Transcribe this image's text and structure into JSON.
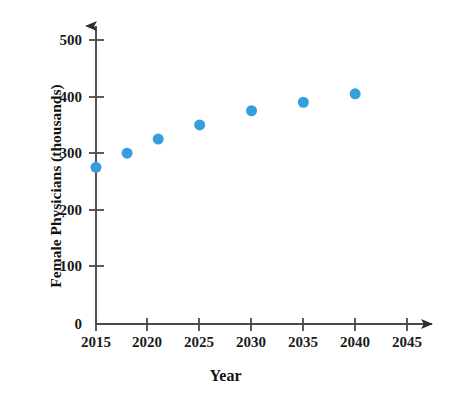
{
  "chart_data": {
    "type": "scatter",
    "title": "",
    "xlabel": "Year",
    "ylabel": "Female Physicians (thousands)",
    "x": [
      2015,
      2018,
      2021,
      2025,
      2030,
      2035,
      2040
    ],
    "values": [
      275,
      300,
      325,
      350,
      375,
      390,
      405
    ],
    "points": [
      {
        "x": 2015,
        "y": 275
      },
      {
        "x": 2018,
        "y": 300
      },
      {
        "x": 2021,
        "y": 325
      },
      {
        "x": 2025,
        "y": 350
      },
      {
        "x": 2030,
        "y": 375
      },
      {
        "x": 2035,
        "y": 390
      },
      {
        "x": 2040,
        "y": 405
      }
    ],
    "series": [
      {
        "name": "Female Physicians",
        "values": [
          275,
          300,
          325,
          350,
          375,
          390,
          405
        ]
      }
    ],
    "xlim": [
      2015,
      2047
    ],
    "ylim": [
      0,
      530
    ],
    "xticks": [
      2015,
      2020,
      2025,
      2030,
      2035,
      2040,
      2045
    ],
    "yticks": [
      0,
      100,
      200,
      300,
      400,
      500
    ],
    "xtick_labels": [
      "2015",
      "2020",
      "2025",
      "2030",
      "2035",
      "2040",
      "2045"
    ],
    "ytick_labels": [
      "0",
      "100",
      "200",
      "300",
      "400",
      "500"
    ],
    "grid": false,
    "legend": null,
    "marker_color": "#359FDE",
    "axis_color": "#3a3a3a",
    "marker_size": 11,
    "annotations": []
  },
  "axes": {
    "y_title": "Female Physicians (thousands)",
    "x_title": "Year"
  }
}
